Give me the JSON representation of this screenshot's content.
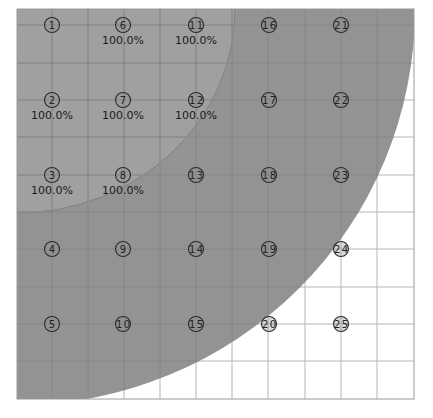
{
  "colors": {
    "background": "#ffffff",
    "outer_region": "#939393",
    "inner_region": "#a0a0a0",
    "inner_boundary": "#808080",
    "grid_minor": "#b0b0b0",
    "grid_on_gray": "#7a7a7a",
    "marker_fill": "#8f8f8f",
    "marker_stroke": "#2a2a2a",
    "text": "#1a1a1a"
  },
  "plot": {
    "left": 17,
    "top": 9,
    "right": 414,
    "bottom": 399,
    "v_lines": [
      52,
      88,
      124,
      160,
      196,
      232,
      268,
      305,
      341,
      377
    ],
    "h_lines": [
      25,
      63,
      100,
      137,
      175,
      212,
      249,
      287,
      324,
      361
    ],
    "outer_region": {
      "cx": 17,
      "cy": 9,
      "rx": 398,
      "ry": 396
    },
    "inner_region": {
      "cx": 17,
      "cy": 9,
      "rx": 218,
      "ry": 204
    }
  },
  "markers": [
    {
      "id": "1",
      "x": 52,
      "y": 25,
      "label": ""
    },
    {
      "id": "2",
      "x": 52,
      "y": 100,
      "label": "100.0%"
    },
    {
      "id": "3",
      "x": 52,
      "y": 175,
      "label": "100.0%"
    },
    {
      "id": "4",
      "x": 52,
      "y": 249,
      "label": ""
    },
    {
      "id": "5",
      "x": 52,
      "y": 324,
      "label": ""
    },
    {
      "id": "6",
      "x": 123,
      "y": 25,
      "label": "100.0%"
    },
    {
      "id": "7",
      "x": 123,
      "y": 100,
      "label": "100.0%"
    },
    {
      "id": "8",
      "x": 123,
      "y": 175,
      "label": "100.0%"
    },
    {
      "id": "9",
      "x": 123,
      "y": 249,
      "label": ""
    },
    {
      "id": "10",
      "x": 123,
      "y": 324,
      "label": ""
    },
    {
      "id": "11",
      "x": 196,
      "y": 25,
      "label": "100.0%"
    },
    {
      "id": "12",
      "x": 196,
      "y": 100,
      "label": "100.0%"
    },
    {
      "id": "13",
      "x": 196,
      "y": 175,
      "label": ""
    },
    {
      "id": "14",
      "x": 196,
      "y": 249,
      "label": ""
    },
    {
      "id": "15",
      "x": 196,
      "y": 324,
      "label": ""
    },
    {
      "id": "16",
      "x": 269,
      "y": 25,
      "label": ""
    },
    {
      "id": "17",
      "x": 269,
      "y": 100,
      "label": ""
    },
    {
      "id": "18",
      "x": 269,
      "y": 175,
      "label": ""
    },
    {
      "id": "19",
      "x": 269,
      "y": 249,
      "label": ""
    },
    {
      "id": "20",
      "x": 269,
      "y": 324,
      "label": ""
    },
    {
      "id": "21",
      "x": 341,
      "y": 25,
      "label": ""
    },
    {
      "id": "22",
      "x": 341,
      "y": 100,
      "label": ""
    },
    {
      "id": "23",
      "x": 341,
      "y": 175,
      "label": ""
    },
    {
      "id": "24",
      "x": 341,
      "y": 249,
      "label": ""
    },
    {
      "id": "25",
      "x": 341,
      "y": 324,
      "label": ""
    }
  ]
}
